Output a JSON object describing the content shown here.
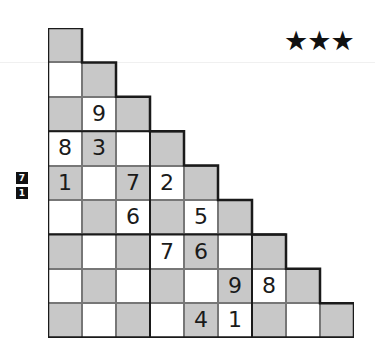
{
  "rating": {
    "stars": "★★★",
    "count": 3
  },
  "clues": [
    {
      "value": "7"
    },
    {
      "value": "1"
    }
  ],
  "puzzle": {
    "type": "staircase sudoku",
    "size": 9,
    "colors": {
      "gray": "#c8c8c8",
      "white": "#ffffff",
      "line": "#1a1a1a"
    },
    "rows": [
      [
        ""
      ],
      [
        "",
        ""
      ],
      [
        "",
        "9",
        ""
      ],
      [
        "8",
        "3",
        "",
        ""
      ],
      [
        "1",
        "",
        "7",
        "2",
        ""
      ],
      [
        "",
        "",
        "6",
        "",
        "5",
        ""
      ],
      [
        "",
        "",
        "",
        "7",
        "6",
        "",
        ""
      ],
      [
        "",
        "",
        "",
        "",
        "",
        "9",
        "8",
        ""
      ],
      [
        "",
        "",
        "",
        "",
        "4",
        "1",
        "",
        "",
        ""
      ]
    ]
  }
}
